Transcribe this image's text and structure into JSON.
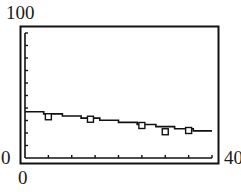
{
  "chart_data": {
    "type": "scatter",
    "title": "",
    "xlabel": "",
    "ylabel": "",
    "xlim": [
      0,
      40
    ],
    "ylim": [
      0,
      100
    ],
    "x_tick_step": 5,
    "y_tick_step": 10,
    "grid": false,
    "corner_labels": {
      "y_max": "100",
      "y_min": "0",
      "x_min": "0",
      "x_max": "40"
    },
    "series": [
      {
        "name": "data",
        "marker": "square",
        "points": [
          {
            "x": 5,
            "y": 33
          },
          {
            "x": 14,
            "y": 31
          },
          {
            "x": 25,
            "y": 26
          },
          {
            "x": 30,
            "y": 21
          },
          {
            "x": 35,
            "y": 22
          }
        ]
      },
      {
        "name": "regression-line",
        "style": "stepped-line",
        "points": [
          {
            "x": 0,
            "y": 37
          },
          {
            "x": 40,
            "y": 20
          }
        ]
      }
    ]
  }
}
